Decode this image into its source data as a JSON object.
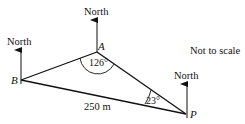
{
  "diagram": {
    "type": "bearing-triangle",
    "note": "Not to scale",
    "north_label": "North",
    "points": {
      "A": {
        "label": "A"
      },
      "B": {
        "label": "B"
      },
      "P": {
        "label": "P"
      }
    },
    "angles": {
      "A": "126°",
      "P": "23°"
    },
    "sides": {
      "BP": "250 m"
    },
    "colors": {
      "line": "#111111",
      "background": "#ffffff"
    }
  }
}
